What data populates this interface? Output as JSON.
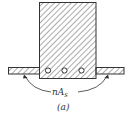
{
  "diagram": {
    "label_main": "nA",
    "label_sub": "s",
    "caption": "(a)",
    "bars_count": 3,
    "colors": {
      "stroke": "#333333",
      "background": "#ffffff"
    }
  }
}
